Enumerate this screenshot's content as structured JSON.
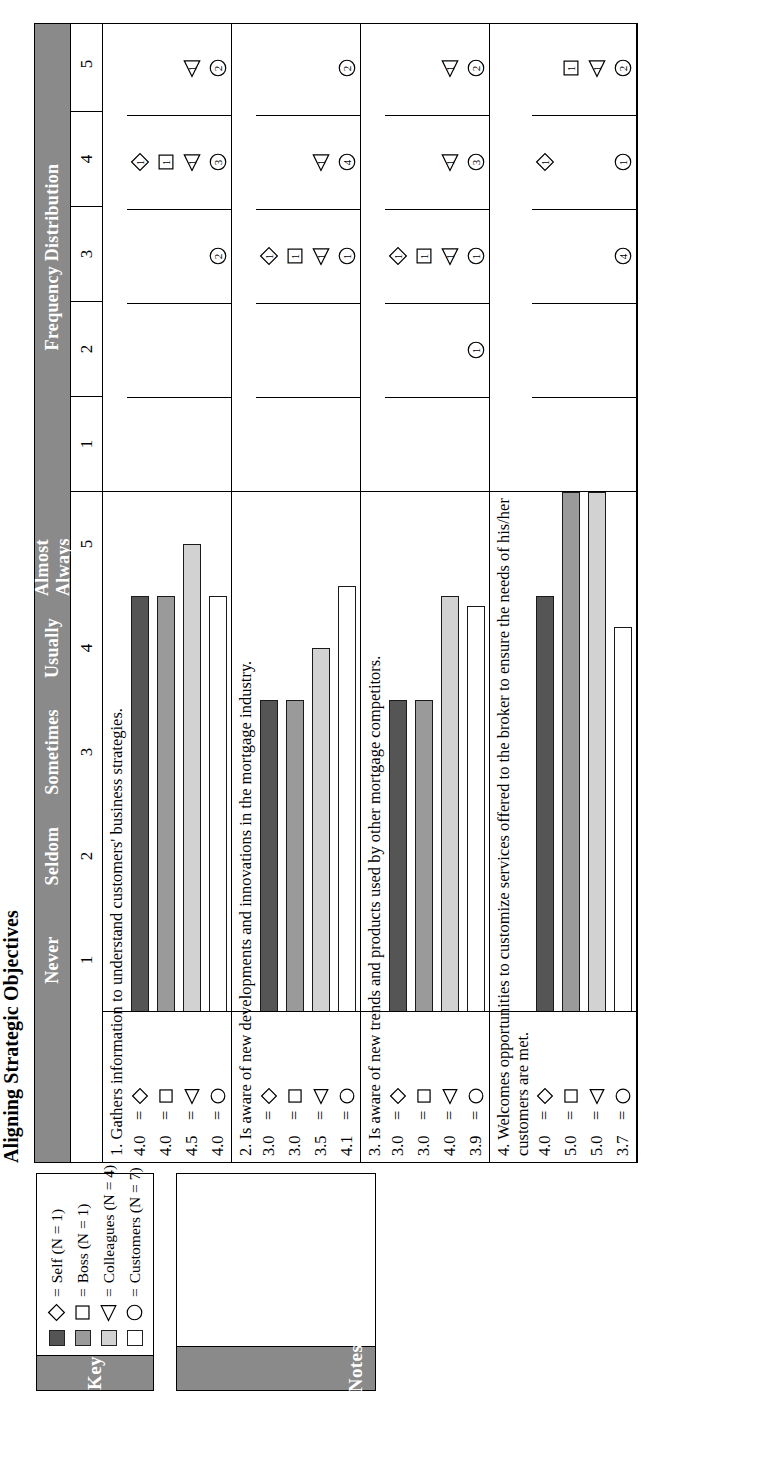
{
  "document": {
    "chart_title": "Aligning Strategic Objectives"
  },
  "key_panel": {
    "header": "Key",
    "entries": [
      {
        "symbol": "diamond",
        "swatch_color": "#555555",
        "eq": "=",
        "label": "Self (N = 1)"
      },
      {
        "symbol": "square",
        "swatch_color": "#9a9a9a",
        "eq": "=",
        "label": "Boss (N = 1)"
      },
      {
        "symbol": "triangle",
        "swatch_color": "#d2d2d2",
        "eq": "=",
        "label": "Colleagues (N = 4)"
      },
      {
        "symbol": "circle",
        "swatch_color": "#ffffff",
        "eq": "=",
        "label": "Customers (N = 7)"
      }
    ]
  },
  "notes_panel": {
    "header": "Notes",
    "body": ""
  },
  "chart_data": {
    "type": "bar",
    "title": "Aligning Strategic Objectives",
    "xlabel": "",
    "ylabel": "",
    "xlim": [
      0,
      5
    ],
    "grid": true,
    "legend_position": "left-key-box",
    "scale_anchors": [
      "Never",
      "Seldom",
      "Sometimes",
      "Usually",
      "Almost Always"
    ],
    "scale_numbers": [
      "1",
      "2",
      "3",
      "4",
      "5"
    ],
    "freq_header": "Frequency Distribution",
    "freq_columns": [
      "1",
      "2",
      "3",
      "4",
      "5"
    ],
    "raters": [
      "Self",
      "Boss",
      "Colleagues",
      "Customers"
    ],
    "rater_symbols": [
      "diamond",
      "square",
      "triangle",
      "circle"
    ],
    "rater_colors": [
      "#555555",
      "#9a9a9a",
      "#d2d2d2",
      "#ffffff"
    ],
    "items": [
      {
        "number": "1.",
        "text": "1.  Gathers information to understand customers' business strategies.",
        "rows": [
          {
            "score": "4.0",
            "eq": "=",
            "symbol": "diamond",
            "color": "#555555",
            "value": 4.0
          },
          {
            "score": "4.0",
            "eq": "=",
            "symbol": "square",
            "color": "#9a9a9a",
            "value": 4.0
          },
          {
            "score": "4.5",
            "eq": "=",
            "symbol": "triangle",
            "color": "#d2d2d2",
            "value": 4.5
          },
          {
            "score": "4.0",
            "eq": "=",
            "symbol": "circle",
            "color": "#ffffff",
            "value": 4.0
          }
        ],
        "frequency": [
          {
            "col": "1",
            "marks": []
          },
          {
            "col": "2",
            "marks": []
          },
          {
            "col": "3",
            "marks": [
              {
                "symbol": "circle",
                "count": "2"
              }
            ]
          },
          {
            "col": "4",
            "marks": [
              {
                "symbol": "diamond",
                "count": "1"
              },
              {
                "symbol": "square",
                "count": "1"
              },
              {
                "symbol": "triangle",
                "count": "1"
              },
              {
                "symbol": "circle",
                "count": "3"
              }
            ]
          },
          {
            "col": "5",
            "marks": [
              {
                "symbol": "triangle",
                "count": "1"
              },
              {
                "symbol": "circle",
                "count": "2"
              }
            ]
          }
        ]
      },
      {
        "number": "2.",
        "text": "2.  Is aware of new developments and innovations in the mortgage industry.",
        "rows": [
          {
            "score": "3.0",
            "eq": "=",
            "symbol": "diamond",
            "color": "#555555",
            "value": 3.0
          },
          {
            "score": "3.0",
            "eq": "=",
            "symbol": "square",
            "color": "#9a9a9a",
            "value": 3.0
          },
          {
            "score": "3.5",
            "eq": "=",
            "symbol": "triangle",
            "color": "#d2d2d2",
            "value": 3.5
          },
          {
            "score": "4.1",
            "eq": "=",
            "symbol": "circle",
            "color": "#ffffff",
            "value": 4.1
          }
        ],
        "frequency": [
          {
            "col": "1",
            "marks": []
          },
          {
            "col": "2",
            "marks": []
          },
          {
            "col": "3",
            "marks": [
              {
                "symbol": "diamond",
                "count": "1"
              },
              {
                "symbol": "square",
                "count": "1"
              },
              {
                "symbol": "triangle",
                "count": "1"
              },
              {
                "symbol": "circle",
                "count": "1"
              }
            ]
          },
          {
            "col": "4",
            "marks": [
              {
                "symbol": "triangle",
                "count": "1"
              },
              {
                "symbol": "circle",
                "count": "4"
              }
            ]
          },
          {
            "col": "5",
            "marks": [
              {
                "symbol": "circle",
                "count": "2"
              }
            ]
          }
        ]
      },
      {
        "number": "3.",
        "text": "3.  Is aware of new trends and products used by other mortgage competitors.",
        "rows": [
          {
            "score": "3.0",
            "eq": "=",
            "symbol": "diamond",
            "color": "#555555",
            "value": 3.0
          },
          {
            "score": "3.0",
            "eq": "=",
            "symbol": "square",
            "color": "#9a9a9a",
            "value": 3.0
          },
          {
            "score": "4.0",
            "eq": "=",
            "symbol": "triangle",
            "color": "#d2d2d2",
            "value": 4.0
          },
          {
            "score": "3.9",
            "eq": "=",
            "symbol": "circle",
            "color": "#ffffff",
            "value": 3.9
          }
        ],
        "frequency": [
          {
            "col": "1",
            "marks": []
          },
          {
            "col": "2",
            "marks": [
              {
                "symbol": "circle",
                "count": "1"
              }
            ]
          },
          {
            "col": "3",
            "marks": [
              {
                "symbol": "diamond",
                "count": "1"
              },
              {
                "symbol": "square",
                "count": "1"
              },
              {
                "symbol": "triangle",
                "count": "1"
              },
              {
                "symbol": "circle",
                "count": "1"
              }
            ]
          },
          {
            "col": "4",
            "marks": [
              {
                "symbol": "triangle",
                "count": "1"
              },
              {
                "symbol": "circle",
                "count": "3"
              }
            ]
          },
          {
            "col": "5",
            "marks": [
              {
                "symbol": "triangle",
                "count": "1"
              },
              {
                "symbol": "circle",
                "count": "2"
              }
            ]
          }
        ]
      },
      {
        "number": "4.",
        "text": "4.  Welcomes opportunities to customize services offered to the broker to ensure the needs of his/her customers are met.",
        "rows": [
          {
            "score": "4.0",
            "eq": "=",
            "symbol": "diamond",
            "color": "#555555",
            "value": 4.0
          },
          {
            "score": "5.0",
            "eq": "=",
            "symbol": "square",
            "color": "#9a9a9a",
            "value": 5.0
          },
          {
            "score": "5.0",
            "eq": "=",
            "symbol": "triangle",
            "color": "#d2d2d2",
            "value": 5.0
          },
          {
            "score": "3.7",
            "eq": "=",
            "symbol": "circle",
            "color": "#ffffff",
            "value": 3.7
          }
        ],
        "frequency": [
          {
            "col": "1",
            "marks": []
          },
          {
            "col": "2",
            "marks": []
          },
          {
            "col": "3",
            "marks": [
              {
                "symbol": "circle",
                "count": "4"
              }
            ]
          },
          {
            "col": "4",
            "marks": [
              {
                "symbol": "diamond",
                "count": "1"
              },
              {
                "symbol": "circle",
                "count": "1"
              }
            ]
          },
          {
            "col": "5",
            "marks": [
              {
                "symbol": "square",
                "count": "1"
              },
              {
                "symbol": "triangle",
                "count": "1"
              },
              {
                "symbol": "circle",
                "count": "2"
              }
            ]
          }
        ]
      }
    ]
  }
}
